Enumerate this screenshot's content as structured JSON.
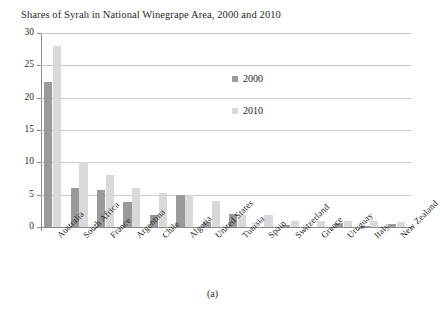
{
  "chart_data": {
    "type": "bar",
    "title": "Shares of Syrah in National Winegrape Area, 2000 and 2010",
    "xlabel": "",
    "ylabel": "",
    "ylim": [
      0,
      30
    ],
    "yticks": [
      0,
      5,
      10,
      15,
      20,
      25,
      30
    ],
    "ytick_labels": [
      "0",
      "5",
      "10",
      "15",
      "20",
      "25",
      "30"
    ],
    "grid": "horizontal",
    "legend_position": "inside-upper-right",
    "categories": [
      "Australia",
      "South Africa",
      "France",
      "Argentina",
      "Chile",
      "Algeria",
      "United States",
      "Tunisia",
      "Spain",
      "Switzerland",
      "Greece",
      "Uruguay",
      "Italy",
      "New Zealand"
    ],
    "series": [
      {
        "name": "2000",
        "color": "#9a9a9a",
        "values": [
          22.4,
          6.0,
          5.8,
          3.9,
          1.8,
          5.0,
          0.8,
          2.0,
          0.0,
          0.3,
          0.0,
          0.6,
          0.1,
          0.5
        ]
      },
      {
        "name": "2010",
        "color": "#d9d9d9",
        "values": [
          28.0,
          10.0,
          8.0,
          6.0,
          5.3,
          4.9,
          4.0,
          1.9,
          1.8,
          1.0,
          1.0,
          0.9,
          0.9,
          0.7
        ]
      }
    ]
  },
  "caption": "(a)",
  "colors": {
    "series_2000": "#9a9a9a",
    "series_2010": "#d9d9d9",
    "gridline": "#c9c9c9",
    "axis": "#8a8a8a",
    "text": "#1f1f1f",
    "background": "#ffffff"
  }
}
